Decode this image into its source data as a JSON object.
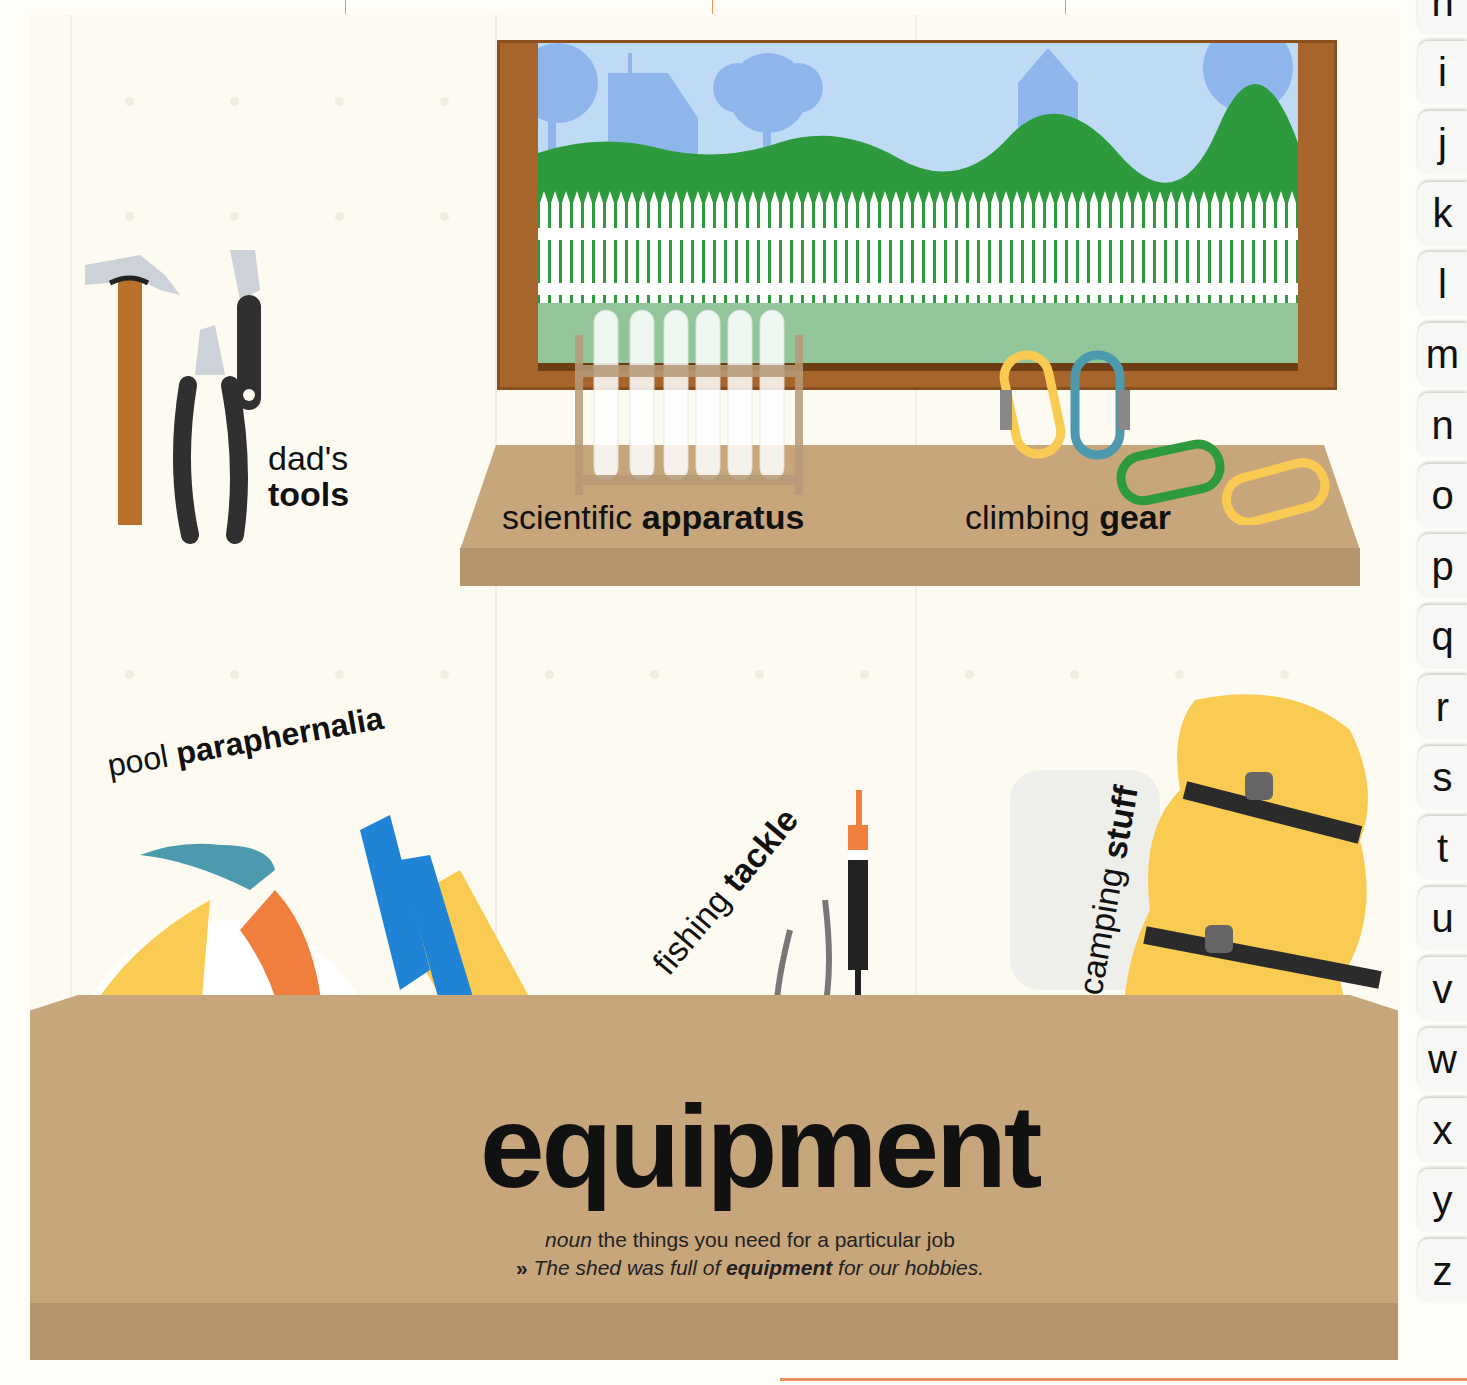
{
  "page": {
    "headword": "equipment",
    "definition": {
      "part_of_speech": "noun",
      "text": "the things you need for a particular job"
    },
    "example": {
      "marker": "»",
      "before": "The shed was full of",
      "bold": "equipment",
      "after": "for our hobbies."
    }
  },
  "labels": [
    {
      "id": "tools",
      "regular": "dad's",
      "bold": "tools"
    },
    {
      "id": "apparatus",
      "regular": "scientific",
      "bold": "apparatus"
    },
    {
      "id": "gear",
      "regular": "climbing",
      "bold": "gear"
    },
    {
      "id": "paraphernalia",
      "regular": "pool",
      "bold": "paraphernalia"
    },
    {
      "id": "tackle",
      "regular": "fishing",
      "bold": "tackle"
    },
    {
      "id": "stuff",
      "regular": "camping",
      "bold": "stuff"
    }
  ],
  "alphabet_tabs": [
    "h",
    "i",
    "j",
    "k",
    "l",
    "m",
    "n",
    "o",
    "p",
    "q",
    "r",
    "s",
    "t",
    "u",
    "v",
    "w",
    "x",
    "y",
    "z"
  ],
  "colors": {
    "wall": "#fdfbf1",
    "wood_top": "#c8a67c",
    "wood_front": "#b6946c",
    "window_frame": "#a7652c",
    "sky": "#bfdaf5",
    "silhouette": "#8fb6ea",
    "hill": "#2e9a3e",
    "lawn": "#92c69a",
    "yellow": "#f9cb52",
    "blue_fin": "#1f84d6",
    "teal": "#4d9aae",
    "orange": "#f07f3d",
    "accent_rule": "#e8945a"
  }
}
